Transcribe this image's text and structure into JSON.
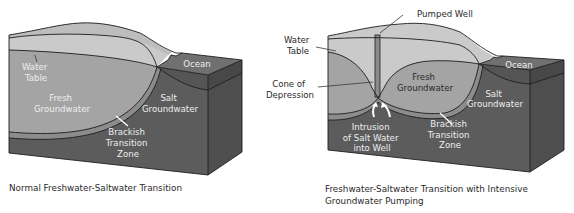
{
  "diagram_left": {
    "labels": {
      "water_table": [
        "Water",
        "Table"
      ],
      "fresh_groundwater": [
        "Fresh",
        "Groundwater"
      ],
      "salt_groundwater": [
        "Salt",
        "Groundwater"
      ],
      "brackish_zone": [
        "Brackish",
        "Transition",
        "Zone"
      ],
      "ocean": "Ocean"
    },
    "caption": "Normal Freshwater-Saltwater Transition"
  },
  "diagram_right": {
    "labels": {
      "pumped_well": "Pumped Well",
      "water_table": [
        "Water",
        "Table"
      ],
      "cone_of_depression": [
        "Cone of",
        "Depression"
      ],
      "fresh_groundwater": [
        "Fresh",
        "Groundwater"
      ],
      "salt_groundwater": [
        "Salt",
        "Groundwater"
      ],
      "brackish_zone": [
        "Brackish",
        "Transition",
        "Zone"
      ],
      "intrusion": [
        "Intrusion",
        "of Salt Water",
        "into Well"
      ],
      "ocean": "Ocean"
    },
    "caption": [
      "Freshwater-Saltwater Transition with Intensive",
      "Groundwater Pumping"
    ]
  },
  "colors": {
    "unsaturated": "#c8c8c8",
    "fresh": "#a2a2a2",
    "brackish": "#8a8a8a",
    "salt": "#5c5c5c",
    "salt_side": "#4e4e4e",
    "ocean_top": "#6e6e6e",
    "ocean_front": "#555555"
  }
}
